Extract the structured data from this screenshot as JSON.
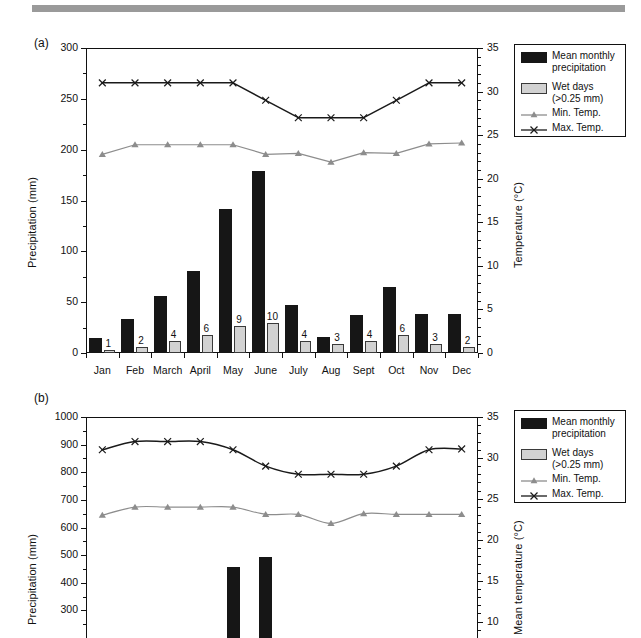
{
  "decor": {
    "top_rule_color": "#9a9a9a"
  },
  "legend": {
    "items": [
      {
        "marker": "filled-black-swatch",
        "label_line1": "Mean monthly",
        "label_line2": "precipitation"
      },
      {
        "marker": "filled-gray-swatch",
        "label_line1": "Wet days",
        "label_line2": "(>0.25 mm)"
      },
      {
        "marker": "gray-triangle-line",
        "label_line1": "Min. Temp.",
        "label_line2": ""
      },
      {
        "marker": "black-x-line",
        "label_line1": "Max. Temp.",
        "label_line2": ""
      }
    ]
  },
  "panels": [
    {
      "tag": "(a)"
    },
    {
      "tag": "(b)"
    }
  ],
  "chart_data": [
    {
      "type": "bar",
      "panel": "(a)",
      "title": "",
      "xlabel": "",
      "ylabel": "Precipitation (mm)",
      "y2label": "Temperature (°C)",
      "categories": [
        "Jan",
        "Feb",
        "March",
        "April",
        "May",
        "June",
        "July",
        "Aug",
        "Sept",
        "Oct",
        "Nov",
        "Dec"
      ],
      "ylim": [
        0,
        300
      ],
      "yticks": [
        0,
        50,
        100,
        150,
        200,
        250,
        300
      ],
      "y2lim": [
        0,
        35
      ],
      "y2ticks": [
        0,
        5,
        10,
        15,
        20,
        25,
        30,
        35
      ],
      "grid": false,
      "legend_position": "outside-right-top",
      "series": [
        {
          "name": "Mean monthly precipitation",
          "type": "bar",
          "axis": "left",
          "unit": "mm",
          "values": [
            15,
            33,
            56,
            81,
            142,
            179,
            47,
            16,
            37,
            65,
            38,
            38
          ]
        },
        {
          "name": "Wet days (>0.25 mm)",
          "type": "bar",
          "axis": "left-scaled",
          "unit": "days",
          "values": [
            1,
            2,
            4,
            6,
            9,
            10,
            4,
            3,
            4,
            6,
            3,
            2
          ],
          "data_labels": [
            "1",
            "2",
            "4",
            "6",
            "9",
            "10",
            "4",
            "3",
            "4",
            "6",
            "3",
            "2"
          ]
        },
        {
          "name": "Min. Temp.",
          "type": "line",
          "axis": "right",
          "unit": "°C",
          "values": [
            22.8,
            23.9,
            23.9,
            23.9,
            23.9,
            22.8,
            22.9,
            21.9,
            23.0,
            22.9,
            24.0,
            24.1
          ]
        },
        {
          "name": "Max. Temp.",
          "type": "line",
          "axis": "right",
          "unit": "°C",
          "values": [
            31.0,
            31.0,
            31.0,
            31.0,
            31.0,
            29.0,
            27.0,
            27.0,
            27.0,
            29.0,
            31.0,
            31.0
          ]
        }
      ]
    },
    {
      "type": "bar",
      "panel": "(b)",
      "title": "",
      "xlabel": "",
      "ylabel": "Precipitation (mm)",
      "y2label": "Mean temperature (°C)",
      "categories": [
        "Jan",
        "Feb",
        "March",
        "April",
        "May",
        "June",
        "July",
        "Aug",
        "Sept",
        "Oct",
        "Nov",
        "Dec"
      ],
      "ylim": [
        200,
        1000
      ],
      "yticks": [
        300,
        400,
        500,
        600,
        700,
        800,
        900,
        1000
      ],
      "y2lim": [
        8,
        35
      ],
      "y2ticks": [
        10,
        15,
        20,
        25,
        30,
        35
      ],
      "grid": false,
      "note": "panel cropped at bottom of screenshot",
      "legend_position": "outside-right-top",
      "series": [
        {
          "name": "Mean monthly precipitation",
          "type": "bar",
          "axis": "left",
          "unit": "mm",
          "values": [
            null,
            null,
            null,
            null,
            457,
            495,
            null,
            null,
            null,
            null,
            null,
            null
          ]
        },
        {
          "name": "Min. Temp.",
          "type": "line",
          "axis": "right",
          "unit": "°C",
          "values": [
            23.0,
            24.0,
            24.0,
            24.0,
            24.0,
            23.1,
            23.1,
            22.0,
            23.2,
            23.1,
            23.1,
            23.1
          ]
        },
        {
          "name": "Max. Temp.",
          "type": "line",
          "axis": "right",
          "unit": "°C",
          "values": [
            31.0,
            32.0,
            32.0,
            32.0,
            31.0,
            29.0,
            28.0,
            28.0,
            28.0,
            29.0,
            31.0,
            31.1
          ]
        }
      ]
    }
  ]
}
